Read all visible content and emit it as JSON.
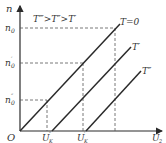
{
  "diagram": {
    "title_relation": "T‴>T″>T′",
    "axes": {
      "y_label": "n",
      "x_label": "U",
      "x_label_sub": "2",
      "origin": "O"
    },
    "y_ticks": [
      {
        "main": "n",
        "sub": "0",
        "sup": ""
      },
      {
        "main": "n",
        "sub": "0",
        "sup": "′"
      },
      {
        "main": "n",
        "sub": "0",
        "sup": "″"
      }
    ],
    "x_ticks": [
      {
        "main": "U",
        "sub": "K",
        "sup": "″"
      },
      {
        "main": "U",
        "sub": "K",
        "sup": "′"
      }
    ],
    "curves": [
      {
        "label": "T=0"
      },
      {
        "label": "T′"
      },
      {
        "label": "T″"
      }
    ],
    "colors": {
      "line": "#2a2a2a",
      "dash": "#555555",
      "text": "#333333"
    }
  }
}
